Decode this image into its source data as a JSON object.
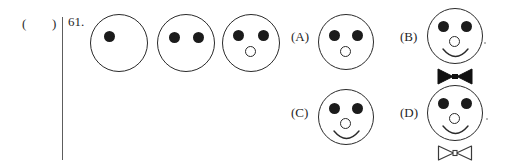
{
  "header": {
    "answer_blank": "(   )",
    "question_number": "61."
  },
  "puzzle": {
    "type": "visual-sequence-completion",
    "sequence": [
      {
        "name": "sequence-figure-1",
        "eyes": 1,
        "eye_positions": [
          "upper-left"
        ],
        "nose": false,
        "smile": false,
        "bowtie": "none"
      },
      {
        "name": "sequence-figure-2",
        "eyes": 2,
        "eye_positions": [
          "upper-left",
          "upper-right"
        ],
        "nose": false,
        "smile": false,
        "bowtie": "none"
      },
      {
        "name": "sequence-figure-3",
        "eyes": 2,
        "eye_positions": [
          "upper-left",
          "upper-right"
        ],
        "nose": true,
        "smile": false,
        "bowtie": "none"
      }
    ],
    "options": [
      {
        "label": "(A)",
        "name": "option-a",
        "eyes": 2,
        "nose": true,
        "smile": false,
        "bowtie": "none"
      },
      {
        "label": "(B)",
        "name": "option-b",
        "eyes": 2,
        "nose": true,
        "smile": true,
        "bowtie": "filled"
      },
      {
        "label": "(C)",
        "name": "option-c",
        "eyes": 2,
        "nose": true,
        "smile": true,
        "bowtie": "none"
      },
      {
        "label": "(D)",
        "name": "option-d",
        "eyes": 2,
        "nose": true,
        "smile": true,
        "bowtie": "outlined"
      }
    ]
  },
  "colors": {
    "ink": "#2a2a2a",
    "fill": "#1b1b1b",
    "paper": "#ffffff",
    "rule": "#5d5d5d"
  }
}
